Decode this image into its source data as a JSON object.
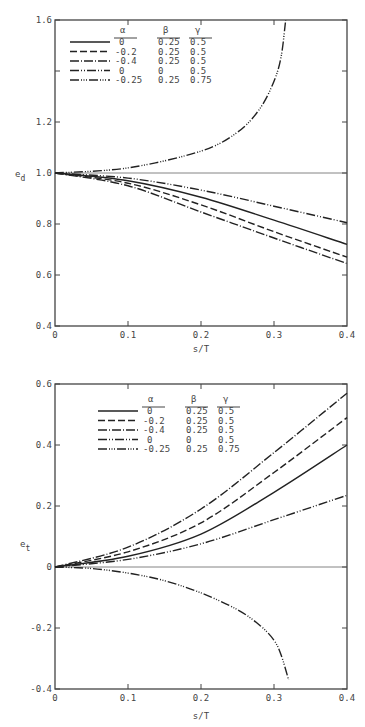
{
  "chart_data": [
    {
      "type": "line",
      "title": "",
      "xlabel": "s/T",
      "ylabel": "e_d",
      "xlim": [
        0,
        0.4
      ],
      "ylim": [
        0.4,
        1.6
      ],
      "xticks": [
        "0",
        "0.1",
        "0.2",
        "0.3",
        "0.4"
      ],
      "yticks": [
        "0.4",
        "0.6",
        "0.8",
        "1.0",
        "1.2",
        "1.6"
      ],
      "grid": false,
      "reference_line": 1.0,
      "legend": {
        "position": "upper-left",
        "headers": [
          "α",
          "β",
          "γ"
        ],
        "rows": [
          {
            "style": "solid",
            "alpha": "0",
            "beta": "0.25",
            "gamma": "0.5"
          },
          {
            "style": "dashed",
            "alpha": "-0.2",
            "beta": "0.25",
            "gamma": "0.5"
          },
          {
            "style": "dash-dot",
            "alpha": "-0.4",
            "beta": "0.25",
            "gamma": "0.5"
          },
          {
            "style": "dash-dot-dot",
            "alpha": "0",
            "beta": "0",
            "gamma": "0.5"
          },
          {
            "style": "dash-dot-dot-dot",
            "alpha": "-0.25",
            "beta": "0.25",
            "gamma": "0.75"
          }
        ]
      },
      "series": [
        {
          "name": "α=0, β=0.25, γ=0.5",
          "style": "solid",
          "x": [
            0,
            0.1,
            0.2,
            0.3,
            0.4
          ],
          "y": [
            1.0,
            0.97,
            0.905,
            0.815,
            0.72
          ]
        },
        {
          "name": "α=-0.2, β=0.25, γ=0.5",
          "style": "dashed",
          "x": [
            0,
            0.1,
            0.2,
            0.3,
            0.4
          ],
          "y": [
            1.0,
            0.96,
            0.875,
            0.77,
            0.67
          ]
        },
        {
          "name": "α=-0.4, β=0.25, γ=0.5",
          "style": "dash-dot",
          "x": [
            0,
            0.1,
            0.2,
            0.3,
            0.4
          ],
          "y": [
            1.0,
            0.95,
            0.847,
            0.745,
            0.645
          ]
        },
        {
          "name": "α=0, β=0, γ=0.5",
          "style": "dash-dot-dot",
          "x": [
            0,
            0.1,
            0.2,
            0.3,
            0.4
          ],
          "y": [
            1.0,
            0.98,
            0.933,
            0.87,
            0.805
          ]
        },
        {
          "name": "α=-0.25, β=0.25, γ=0.75",
          "style": "dash-dot-dot-dot",
          "x": [
            0,
            0.1,
            0.2,
            0.25,
            0.28,
            0.3,
            0.31,
            0.316
          ],
          "y": [
            1.0,
            1.02,
            1.086,
            1.16,
            1.25,
            1.36,
            1.46,
            1.6
          ]
        }
      ]
    },
    {
      "type": "line",
      "title": "",
      "xlabel": "s/T",
      "ylabel": "e_t",
      "xlim": [
        0,
        0.4
      ],
      "ylim": [
        -0.4,
        0.6
      ],
      "xticks": [
        "0",
        "0.1",
        "0.2",
        "0.3",
        "0.4"
      ],
      "yticks": [
        "-0.4",
        "-0.2",
        "0",
        "0.2",
        "0.4",
        "0.6"
      ],
      "grid": false,
      "reference_line": 0,
      "legend": {
        "position": "upper-left",
        "headers": [
          "α",
          "β",
          "γ"
        ],
        "rows": [
          {
            "style": "solid",
            "alpha": "0",
            "beta": "0.25",
            "gamma": "0.5"
          },
          {
            "style": "dashed",
            "alpha": "-0.2",
            "beta": "0.25",
            "gamma": "0.5"
          },
          {
            "style": "dash-dot",
            "alpha": "-0.4",
            "beta": "0.25",
            "gamma": "0.5"
          },
          {
            "style": "dash-dot-dot",
            "alpha": "0",
            "beta": "0",
            "gamma": "0.5"
          },
          {
            "style": "dash-dot-dot-dot",
            "alpha": "-0.25",
            "beta": "0.25",
            "gamma": "0.75"
          }
        ]
      },
      "series": [
        {
          "name": "α=0, β=0.25, γ=0.5",
          "style": "solid",
          "x": [
            0,
            0.1,
            0.2,
            0.3,
            0.4
          ],
          "y": [
            0,
            0.035,
            0.108,
            0.245,
            0.4
          ]
        },
        {
          "name": "α=-0.2, β=0.25, γ=0.5",
          "style": "dashed",
          "x": [
            0,
            0.1,
            0.2,
            0.3,
            0.4
          ],
          "y": [
            0,
            0.05,
            0.145,
            0.31,
            0.49
          ]
        },
        {
          "name": "α=-0.4, β=0.25, γ=0.5",
          "style": "dash-dot",
          "x": [
            0,
            0.1,
            0.2,
            0.3,
            0.4
          ],
          "y": [
            0,
            0.065,
            0.19,
            0.375,
            0.57
          ]
        },
        {
          "name": "α=0, β=0, γ=0.5",
          "style": "dash-dot-dot",
          "x": [
            0,
            0.1,
            0.2,
            0.3,
            0.4
          ],
          "y": [
            0,
            0.025,
            0.076,
            0.155,
            0.235
          ]
        },
        {
          "name": "α=-0.25, β=0.25, γ=0.75",
          "style": "dash-dot-dot-dot",
          "x": [
            0,
            0.05,
            0.1,
            0.15,
            0.2,
            0.25,
            0.28,
            0.3,
            0.31,
            0.32
          ],
          "y": [
            0,
            -0.005,
            -0.02,
            -0.045,
            -0.085,
            -0.14,
            -0.19,
            -0.24,
            -0.29,
            -0.37
          ]
        }
      ]
    }
  ]
}
